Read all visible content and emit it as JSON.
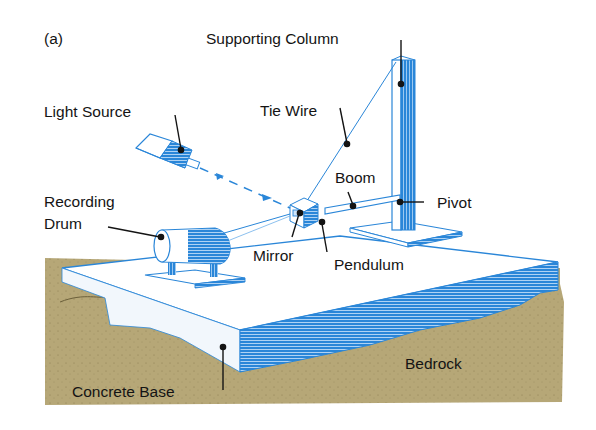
{
  "figure": {
    "panel_label": "(a)",
    "colors": {
      "ink": "#141414",
      "blue": "#2a86d8",
      "blue_light": "#6fb0ea",
      "bedrock": "#b6a777",
      "bedrock_dark": "#8c7e52",
      "concrete": "#ffffff",
      "background": "#ffffff"
    },
    "labels": [
      {
        "id": "supporting-column",
        "text": "Supporting Column"
      },
      {
        "id": "tie-wire",
        "text": "Tie Wire"
      },
      {
        "id": "light-source",
        "text": "Light Source"
      },
      {
        "id": "boom",
        "text": "Boom"
      },
      {
        "id": "pivot",
        "text": "Pivot"
      },
      {
        "id": "recording-drum-1",
        "text": "Recording"
      },
      {
        "id": "recording-drum-2",
        "text": "Drum"
      },
      {
        "id": "mirror",
        "text": "Mirror"
      },
      {
        "id": "pendulum",
        "text": "Pendulum"
      },
      {
        "id": "bedrock",
        "text": "Bedrock"
      },
      {
        "id": "concrete-base",
        "text": "Concrete Base"
      }
    ]
  }
}
